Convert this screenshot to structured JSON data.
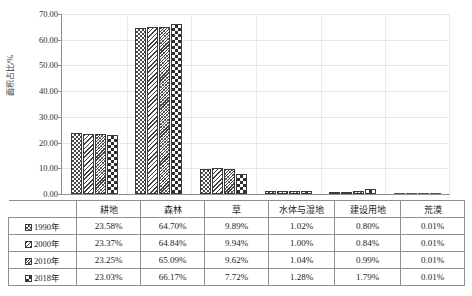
{
  "figure": {
    "top_strip_text": "",
    "caption": ""
  },
  "chart_data": {
    "type": "bar",
    "title": "",
    "xlabel": "",
    "ylabel": "面积占比/%",
    "ylim": [
      0,
      70
    ],
    "ytick_step": 10,
    "grid": true,
    "legend_position": "table-below",
    "categories": [
      "耕地",
      "森林",
      "草",
      "水体与湿地",
      "建设用地",
      "荒漠"
    ],
    "ytick_labels": [
      "0.00",
      "10.00",
      "20.00",
      "30.00",
      "40.00",
      "50.00",
      "60.00",
      "70.00"
    ],
    "series": [
      {
        "name": "1990年",
        "pattern": "checkerboard",
        "values": [
          23.58,
          64.7,
          9.89,
          1.02,
          0.8,
          0.01
        ],
        "labels": [
          "23.58%",
          "64.70%",
          "9.89%",
          "1.02%",
          "0.80%",
          "0.01%"
        ]
      },
      {
        "name": "2000年",
        "pattern": "diagonal-hatch",
        "values": [
          23.37,
          64.84,
          9.94,
          1.0,
          0.84,
          0.01
        ],
        "labels": [
          "23.37%",
          "64.84%",
          "9.94%",
          "1.00%",
          "0.84%",
          "0.01%"
        ]
      },
      {
        "name": "2010年",
        "pattern": "fine-crosshatch",
        "values": [
          23.25,
          65.09,
          9.62,
          1.04,
          0.99,
          0.01
        ],
        "labels": [
          "23.25%",
          "65.09%",
          "9.62%",
          "1.04%",
          "0.99%",
          "0.01%"
        ]
      },
      {
        "name": "2018年",
        "pattern": "coarse-dots",
        "values": [
          23.03,
          66.17,
          7.72,
          1.28,
          1.79,
          0.01
        ],
        "labels": [
          "23.03%",
          "66.17%",
          "7.72%",
          "1.28%",
          "1.79%",
          "0.01%"
        ]
      }
    ]
  },
  "colors": {
    "axis": "#8e8e96",
    "gridline": "#e6e6ea",
    "bar_outline": "#3a3a3a",
    "table_border": "#8f8f97",
    "text": "#232323"
  }
}
